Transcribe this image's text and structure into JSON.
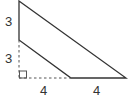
{
  "diagram": {
    "type": "geometry-trapezoid",
    "colors": {
      "line": "#333333",
      "dashed": "#555555",
      "background": "#ffffff"
    },
    "labels": {
      "left_upper": "3",
      "left_lower": "3",
      "bottom_left": "4",
      "bottom_right": "4"
    },
    "shapes": {
      "right_angle_marker": "square"
    }
  }
}
